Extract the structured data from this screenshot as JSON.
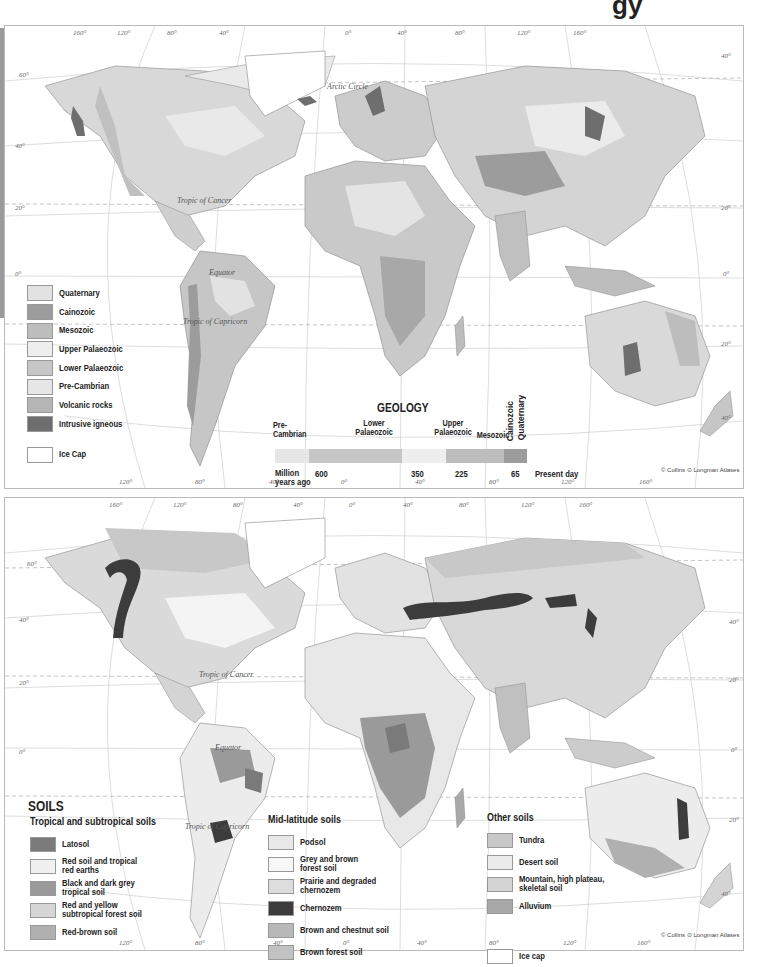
{
  "page": {
    "title_fragment": "gy"
  },
  "colors": {
    "quaternary": "#e2e2e2",
    "cainozoic": "#9c9c9c",
    "mesozoic": "#bdbdbd",
    "upper_palaeozoic": "#eeeeee",
    "lower_palaeozoic": "#c6c6c6",
    "pre_cambrian": "#e6e6e6",
    "volcanic_rocks": "#b5b5b5",
    "intrusive_igneous": "#6e6e6e",
    "ice_cap": "#ffffff",
    "latosol": "#7a7a7a",
    "red_soil": "#f0f0f0",
    "black_dark_grey": "#9a9a9a",
    "red_yellow": "#d6d6d6",
    "red_brown": "#b0b0b0",
    "podsol": "#e8e8e8",
    "grey_brown_forest": "#f7f7f7",
    "prairie": "#dddddd",
    "chernozem": "#3c3c3c",
    "brown_chestnut": "#b8b8b8",
    "brown_forest": "#c2c2c2",
    "tundra": "#c8c8c8",
    "desert": "#ececec",
    "mountain": "#d4d4d4",
    "alluvium": "#a8a8a8",
    "ocean": "#ffffff",
    "grid": "#c8c8c8"
  },
  "geology_map": {
    "labels": {
      "arctic_circle": "Arctic Circle",
      "tropic_of_cancer": "Tropic of Cancer",
      "equator": "Equator",
      "tropic_of_capricorn": "Tropic of Capricorn"
    },
    "degree_labels": {
      "top": [
        "160°",
        "120°",
        "80°",
        "40°",
        "0°",
        "40°",
        "80°",
        "120°",
        "160°"
      ],
      "left": [
        "60°",
        "40°",
        "20°",
        "0°"
      ],
      "right": [
        "40°",
        "20°",
        "0°",
        "20°",
        "40°"
      ],
      "bottom": [
        "120°",
        "80°",
        "40°",
        "0°",
        "40°",
        "80°",
        "120°",
        "160°"
      ]
    },
    "legend": [
      {
        "label": "Quaternary",
        "color_key": "quaternary"
      },
      {
        "label": "Cainozoic",
        "color_key": "cainozoic"
      },
      {
        "label": "Mesozoic",
        "color_key": "mesozoic"
      },
      {
        "label": "Upper Palaeozoic",
        "color_key": "upper_palaeozoic"
      },
      {
        "label": "Lower Palaeozoic",
        "color_key": "lower_palaeozoic"
      },
      {
        "label": "Pre-Cambrian",
        "color_key": "pre_cambrian"
      },
      {
        "label": "Volcanic rocks",
        "color_key": "volcanic_rocks"
      },
      {
        "label": "Intrusive igneous",
        "color_key": "intrusive_igneous"
      },
      {
        "label": "Ice Cap",
        "color_key": "ice_cap"
      }
    ],
    "timeline": {
      "title": "GEOLOGY",
      "eras": [
        {
          "label_line1": "Pre-",
          "label_line2": "Cambrian"
        },
        {
          "label_line1": "Lower",
          "label_line2": "Palaeozoic"
        },
        {
          "label_line1": "Upper",
          "label_line2": "Palaeozoic"
        },
        {
          "label_line1": "",
          "label_line2": "Mesozoic"
        },
        {
          "label_line1": "Cainozoic",
          "label_line2": ""
        },
        {
          "label_line1": "Quaternary",
          "label_line2": ""
        }
      ],
      "ticks": {
        "start_line1": "Million",
        "start_line2": "years ago",
        "t600": "600",
        "t350": "350",
        "t225": "225",
        "t65": "65",
        "present": "Present day"
      }
    },
    "credit": "© Collins ⊙ Longman Atlases"
  },
  "soils_map": {
    "title": "SOILS",
    "labels": {
      "tropic_of_cancer": "Tropic of Cancer",
      "equator": "Equator",
      "tropic_of_capricorn": "Tropic of Capricorn"
    },
    "degree_labels": {
      "top": [
        "160°",
        "120°",
        "80°",
        "40°",
        "0°",
        "40°",
        "80°",
        "120°",
        "160°"
      ],
      "left": [
        "60°",
        "40°",
        "20°",
        "0°"
      ],
      "right": [
        "40°",
        "20°",
        "0°",
        "20°",
        "40°"
      ],
      "bottom": [
        "120°",
        "80°",
        "40°",
        "0°",
        "40°",
        "80°",
        "120°",
        "160°"
      ]
    },
    "groups": {
      "tropical": {
        "title": "Tropical and subtropical soils",
        "items": [
          {
            "line1": "Latosol",
            "line2": "",
            "color_key": "latosol"
          },
          {
            "line1": "Red soil and tropical",
            "line2": "red earths",
            "color_key": "red_soil"
          },
          {
            "line1": "Black and dark grey",
            "line2": "tropical soil",
            "color_key": "black_dark_grey"
          },
          {
            "line1": "Red and yellow",
            "line2": "subtropical forest soil",
            "color_key": "red_yellow"
          },
          {
            "line1": "Red-brown soil",
            "line2": "",
            "color_key": "red_brown"
          }
        ]
      },
      "mid_latitude": {
        "title": "Mid-latitude soils",
        "items": [
          {
            "line1": "Podsol",
            "line2": "",
            "color_key": "podsol"
          },
          {
            "line1": "Grey and brown",
            "line2": "forest soil",
            "color_key": "grey_brown_forest"
          },
          {
            "line1": "Prairie and degraded",
            "line2": "chernozem",
            "color_key": "prairie"
          },
          {
            "line1": "Chernozem",
            "line2": "",
            "color_key": "chernozem"
          },
          {
            "line1": "Brown and chestnut soil",
            "line2": "",
            "color_key": "brown_chestnut"
          },
          {
            "line1": "Brown forest soil",
            "line2": "",
            "color_key": "brown_forest"
          }
        ]
      },
      "other": {
        "title": "Other soils",
        "items": [
          {
            "line1": "Tundra",
            "line2": "",
            "color_key": "tundra"
          },
          {
            "line1": "Desert soil",
            "line2": "",
            "color_key": "desert"
          },
          {
            "line1": "Mountain, high plateau,",
            "line2": "skeletal soil",
            "color_key": "mountain"
          },
          {
            "line1": "Alluvium",
            "line2": "",
            "color_key": "alluvium"
          },
          {
            "line1": "Ice cap",
            "line2": "",
            "color_key": "ice_cap"
          }
        ]
      }
    },
    "credit": "© Collins ⊙ Longman Atlases"
  }
}
